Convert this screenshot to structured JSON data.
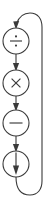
{
  "diagram": {
    "title": "Arithmetic operator cycle",
    "type": "vertical-flow-cycle",
    "orientation": "top-to-bottom",
    "background_color": "#ffffff",
    "stroke_color": "#3a3a3a",
    "node_fill": "#ffffff",
    "node_count": 4,
    "nodes": [
      {
        "id": "node-divide",
        "symbol": "÷",
        "symbol_name": "division-sign",
        "label": "divide",
        "order": 1,
        "center_x": 16,
        "center_y": 41,
        "radius": 13
      },
      {
        "id": "node-multiply",
        "symbol": "×",
        "symbol_name": "multiplication-sign",
        "label": "multiply",
        "order": 2,
        "center_x": 16,
        "center_y": 83,
        "radius": 13
      },
      {
        "id": "node-minus",
        "symbol": "−",
        "symbol_name": "minus-sign",
        "label": "minus",
        "order": 3,
        "center_x": 16,
        "center_y": 123,
        "radius": 13
      },
      {
        "id": "node-down-arrow",
        "symbol": "↓",
        "symbol_name": "down-arrow",
        "label": "output",
        "order": 4,
        "center_x": 16,
        "center_y": 164,
        "radius": 13
      }
    ],
    "connectors": [
      {
        "id": "connector-divide-to-multiply",
        "from": "node-divide",
        "to": "node-multiply",
        "style": "straight-arrow",
        "direction": "down"
      },
      {
        "id": "connector-multiply-to-minus",
        "from": "node-multiply",
        "to": "node-minus",
        "style": "straight-arrow",
        "direction": "down"
      },
      {
        "id": "connector-minus-to-output",
        "from": "node-minus",
        "to": "node-down-arrow",
        "style": "straight-arrow",
        "direction": "down"
      },
      {
        "id": "connector-feedback-loop",
        "from": "node-down-arrow",
        "to": "node-divide",
        "style": "curved-arrow",
        "direction": "bottom-right-up-to-top",
        "description": "feedback loop running along the right edge"
      }
    ]
  }
}
